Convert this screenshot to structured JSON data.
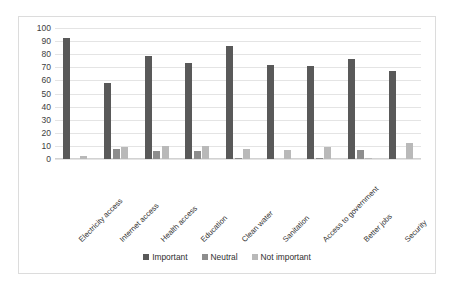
{
  "chart_data": {
    "type": "bar",
    "title": "",
    "xlabel": "",
    "ylabel": "",
    "ylim": [
      0,
      100
    ],
    "yticks": [
      0,
      10,
      20,
      30,
      40,
      50,
      60,
      70,
      80,
      90,
      100
    ],
    "grid": true,
    "legend_position": "bottom",
    "categories": [
      "Electricity access",
      "Internet access",
      "Health access",
      "Education",
      "Clean water",
      "Sanitation",
      "Access to government",
      "Better jobs",
      "Security"
    ],
    "series": [
      {
        "name": "Important",
        "color": "#595959",
        "values": [
          92,
          58,
          79,
          73,
          86,
          72,
          71,
          76,
          67
        ]
      },
      {
        "name": "Neutral",
        "color": "#8d8d8d",
        "values": [
          0,
          8,
          6,
          6,
          1,
          0,
          1,
          7,
          0
        ]
      },
      {
        "name": "Not important",
        "color": "#b9b9b9",
        "values": [
          2,
          9,
          10,
          10,
          8,
          7,
          9,
          1,
          12
        ]
      }
    ]
  }
}
